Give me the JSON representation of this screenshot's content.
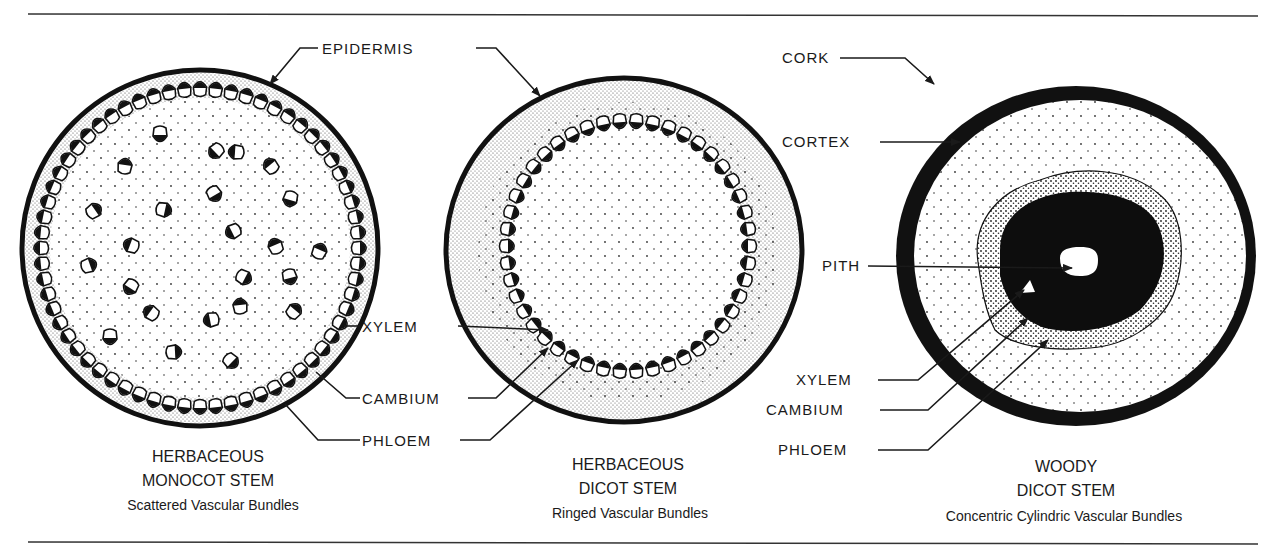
{
  "figure": {
    "panels": [
      {
        "id": "monocot",
        "title_line1": "HERBACEOUS",
        "title_line2": "MONOCOT STEM",
        "subtitle": "Scattered Vascular Bundles"
      },
      {
        "id": "herb_dicot",
        "title_line1": "HERBACEOUS",
        "title_line2": "DICOT STEM",
        "subtitle": "Ringed Vascular Bundles"
      },
      {
        "id": "woody_dicot",
        "title_line1": "WOODY",
        "title_line2": "DICOT STEM",
        "subtitle": "Concentric Cylindric Vascular Bundles"
      }
    ],
    "labels": {
      "epidermis": "EPIDERMIS",
      "xylem": "XYLEM",
      "cambium": "CAMBIUM",
      "phloem": "PHLOEM",
      "cork": "CORK",
      "cortex": "CORTEX",
      "pith": "PITH",
      "woody_xylem": "XYLEM",
      "woody_cambium": "CAMBIUM",
      "woody_phloem": "PHLOEM"
    },
    "colors": {
      "ink": "#1a1a1a",
      "paper": "#ffffff",
      "stipple": "#555555"
    }
  }
}
